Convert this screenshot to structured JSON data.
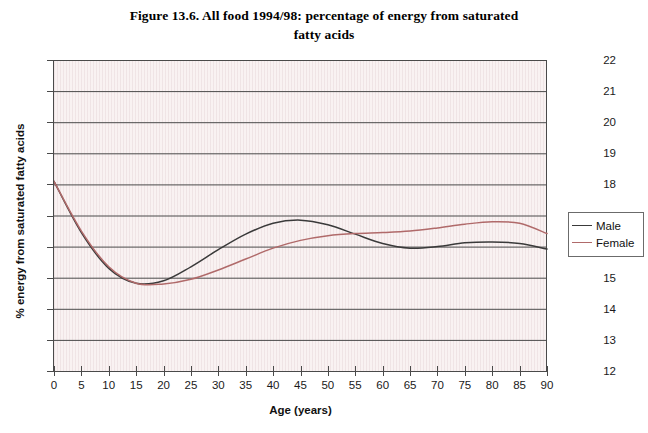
{
  "figure": {
    "title_line1": "Figure 13.6. All food 1994/98: percentage of energy from saturated",
    "title_line2": "fatty acids"
  },
  "legend": {
    "position": "right",
    "items": [
      {
        "label": "Male",
        "color": "#3a3a3a"
      },
      {
        "label": "Female",
        "color": "#b06a6a"
      }
    ]
  },
  "chart_data": {
    "type": "line",
    "title": "Figure 13.6. All food 1994/98: percentage of energy from saturated fatty acids",
    "xlabel": "Age (years)",
    "ylabel": "% energy from saturated fatty acids",
    "xlim": [
      0,
      90
    ],
    "ylim": [
      12,
      22
    ],
    "xticks": [
      0,
      5,
      10,
      15,
      20,
      25,
      30,
      35,
      40,
      45,
      50,
      55,
      60,
      65,
      70,
      75,
      80,
      85,
      90
    ],
    "yticks": [
      12,
      13,
      14,
      15,
      16,
      17,
      18,
      19,
      20,
      21,
      22
    ],
    "grid": "horizontal",
    "x": [
      0,
      5,
      10,
      15,
      20,
      25,
      30,
      35,
      40,
      45,
      50,
      55,
      60,
      65,
      70,
      75,
      80,
      85,
      90
    ],
    "series": [
      {
        "name": "Male",
        "color": "#3a3a3a",
        "values": [
          18.1,
          16.45,
          15.3,
          14.82,
          14.9,
          15.35,
          15.9,
          16.4,
          16.75,
          16.85,
          16.7,
          16.4,
          16.1,
          15.95,
          16.0,
          16.12,
          16.15,
          16.1,
          15.92
        ]
      },
      {
        "name": "Female",
        "color": "#b06a6a",
        "values": [
          18.1,
          16.5,
          15.35,
          14.82,
          14.8,
          14.95,
          15.25,
          15.6,
          15.95,
          16.2,
          16.35,
          16.42,
          16.45,
          16.5,
          16.6,
          16.72,
          16.8,
          16.75,
          16.42
        ]
      }
    ]
  },
  "axes": {
    "y_tick_labels": [
      "22",
      "21",
      "20",
      "19",
      "18",
      "17",
      "16",
      "15",
      "14",
      "13",
      "12"
    ],
    "x_tick_labels": [
      "0",
      "5",
      "10",
      "15",
      "20",
      "25",
      "30",
      "35",
      "40",
      "45",
      "50",
      "55",
      "60",
      "65",
      "70",
      "75",
      "80",
      "85",
      "90"
    ],
    "x_title": "Age (years)",
    "y_title": "% energy from saturated fatty acids"
  },
  "colors": {
    "plot_background": "#f9f2f2",
    "gridline": "#4a4a4a",
    "axis": "#4a4a4a"
  }
}
